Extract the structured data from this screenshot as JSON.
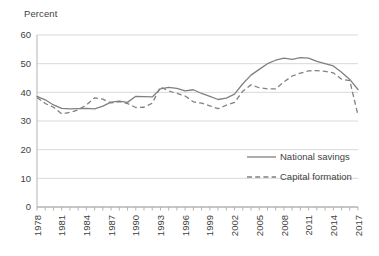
{
  "chart_data": {
    "type": "line",
    "title": "",
    "ylabel": "Percent",
    "xlabel": "",
    "ylim": [
      0,
      60
    ],
    "yticks": [
      0,
      10,
      20,
      30,
      40,
      50,
      60
    ],
    "grid": true,
    "legend_position": "lower-right",
    "x": [
      1978,
      1979,
      1980,
      1981,
      1982,
      1983,
      1984,
      1985,
      1986,
      1987,
      1988,
      1989,
      1990,
      1991,
      1992,
      1993,
      1994,
      1995,
      1996,
      1997,
      1998,
      1999,
      2000,
      2001,
      2002,
      2003,
      2004,
      2005,
      2006,
      2007,
      2008,
      2009,
      2010,
      2011,
      2012,
      2013,
      2014,
      2015,
      2016,
      2017
    ],
    "xtick_labels": [
      "1978",
      "1981",
      "1984",
      "1987",
      "1990",
      "1993",
      "1996",
      "1999",
      "2002",
      "2005",
      "2008",
      "2011",
      "2014",
      "2017"
    ],
    "series": [
      {
        "name": "National savings",
        "style": "solid",
        "color": "#808080",
        "values": [
          38.6,
          37.4,
          35.6,
          34.4,
          34.2,
          34.3,
          34.4,
          34.2,
          35.2,
          36.6,
          36.9,
          36.5,
          38.6,
          38.5,
          38.4,
          41.2,
          41.7,
          41.4,
          40.5,
          40.9,
          39.6,
          38.6,
          37.5,
          38.0,
          39.4,
          43.0,
          46.0,
          48.0,
          50.0,
          51.2,
          51.9,
          51.5,
          52.1,
          51.9,
          50.8,
          50.0,
          49.2,
          47.0,
          44.5,
          41.0
        ]
      },
      {
        "name": "Capital formation",
        "style": "dashed",
        "color": "#808080",
        "values": [
          38.2,
          36.1,
          34.8,
          32.5,
          33.0,
          33.9,
          35.6,
          38.1,
          37.6,
          36.3,
          36.8,
          36.1,
          34.7,
          34.8,
          36.2,
          41.9,
          40.5,
          39.6,
          38.7,
          36.7,
          36.2,
          35.3,
          34.3,
          35.5,
          36.5,
          40.4,
          42.6,
          41.6,
          41.2,
          41.2,
          43.6,
          45.7,
          46.7,
          47.5,
          47.6,
          47.3,
          46.8,
          44.6,
          44.1,
          32.0
        ]
      }
    ]
  },
  "legend": {
    "entries": [
      {
        "label": "National savings",
        "style": "solid"
      },
      {
        "label": "Capital formation",
        "style": "dashed"
      }
    ]
  }
}
